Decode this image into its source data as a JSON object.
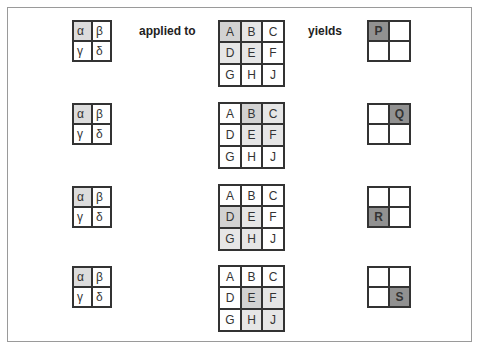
{
  "labels": {
    "applied_to": "applied to",
    "yields": "yields"
  },
  "kernel": [
    "α",
    "β",
    "γ",
    "δ"
  ],
  "input": [
    "A",
    "B",
    "C",
    "D",
    "E",
    "F",
    "G",
    "H",
    "J"
  ],
  "steps": [
    {
      "input_highlight": [
        0,
        1,
        3,
        4
      ],
      "input_focus": 0,
      "output": [
        "P",
        "",
        "",
        ""
      ],
      "output_on": 0
    },
    {
      "input_highlight": [
        1,
        2,
        4,
        5
      ],
      "input_focus": 1,
      "output": [
        "",
        "Q",
        "",
        ""
      ],
      "output_on": 1
    },
    {
      "input_highlight": [
        3,
        4,
        6,
        7
      ],
      "input_focus": 3,
      "output": [
        "",
        "",
        "R",
        ""
      ],
      "output_on": 2
    },
    {
      "input_highlight": [
        4,
        5,
        7,
        8
      ],
      "input_focus": 4,
      "output": [
        "",
        "",
        "",
        "S"
      ],
      "output_on": 3
    }
  ],
  "colors": {
    "kernel_highlight": "#dcdcdc",
    "input_highlight": "#e6e6e6",
    "input_focus": "#d2d2d2",
    "output_on": "#919191",
    "grid_line": "#333333"
  }
}
